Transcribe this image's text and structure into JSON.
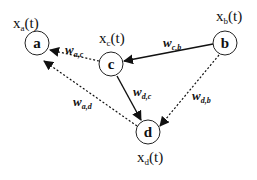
{
  "diagram": {
    "type": "directed graph",
    "nodes": [
      {
        "id": "a",
        "letter": "a",
        "state_base": "x",
        "state_sub": "a",
        "state_tail": "(t)"
      },
      {
        "id": "b",
        "letter": "b",
        "state_base": "x",
        "state_sub": "b",
        "state_tail": "(t)"
      },
      {
        "id": "c",
        "letter": "c",
        "state_base": "x",
        "state_sub": "c",
        "state_tail": "(t)"
      },
      {
        "id": "d",
        "letter": "d",
        "state_base": "x",
        "state_sub": "d",
        "state_tail": "(t)"
      }
    ],
    "edges": [
      {
        "from": "b",
        "to": "c",
        "style": "solid",
        "weight_base": "w",
        "weight_sub": "c,b"
      },
      {
        "from": "c",
        "to": "a",
        "style": "dotted",
        "weight_base": "w",
        "weight_sub": "a,c"
      },
      {
        "from": "c",
        "to": "d",
        "style": "solid",
        "weight_base": "w",
        "weight_sub": "d,c"
      },
      {
        "from": "d",
        "to": "a",
        "style": "dotted",
        "weight_base": "w",
        "weight_sub": "a,d"
      },
      {
        "from": "b",
        "to": "d",
        "style": "dotted",
        "weight_base": "w",
        "weight_sub": "d,b"
      }
    ]
  }
}
